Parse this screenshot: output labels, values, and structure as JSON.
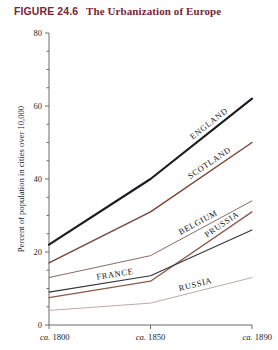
{
  "figure": {
    "number": "FIGURE 24.6",
    "title": "The Urbanization of Europe"
  },
  "chart_data": {
    "type": "line",
    "title": "The Urbanization of Europe",
    "xlabel": "",
    "ylabel": "Percent of population in cities over 10,000",
    "categories": [
      "ca. 1800",
      "ca. 1850",
      "ca. 1890"
    ],
    "x_tick_labels": [
      "ca. 1800",
      "ca. 1850",
      "ca. 1890"
    ],
    "y_tick_labels": [
      "0",
      "20",
      "40",
      "60",
      "80"
    ],
    "y_ticks": [
      0,
      20,
      40,
      60,
      80
    ],
    "ylim": [
      0,
      80
    ],
    "grid": false,
    "legend": "inline-labels",
    "series": [
      {
        "name": "ENGLAND",
        "values": [
          22,
          40,
          62
        ],
        "color": "#1c1c22",
        "width": 2.2
      },
      {
        "name": "SCOTLAND",
        "values": [
          17,
          31,
          50
        ],
        "color": "#7a4638",
        "width": 1.5
      },
      {
        "name": "BELGIUM",
        "values": [
          13,
          19,
          34
        ],
        "color": "#8a6a62",
        "width": 1.0
      },
      {
        "name": "PRUSSIA",
        "values": [
          7.5,
          12,
          31
        ],
        "color": "#8a5a4a",
        "width": 1.3
      },
      {
        "name": "FRANCE",
        "values": [
          9,
          13.5,
          26
        ],
        "color": "#33333a",
        "width": 1.1
      },
      {
        "name": "RUSSIA",
        "values": [
          4,
          6,
          13
        ],
        "color": "#c2a7a7",
        "width": 1.0
      }
    ]
  },
  "colors": {
    "heading": "#7a2535",
    "axis": "#6b6b6b",
    "text": "#1a1a1a"
  }
}
